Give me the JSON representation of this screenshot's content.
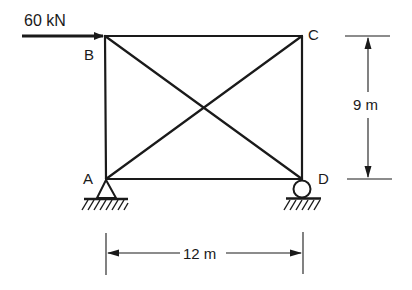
{
  "load": {
    "label": "60 kN",
    "direction": "right",
    "applied_at": "B"
  },
  "nodes": [
    {
      "id": "A",
      "label": "A",
      "x": 106,
      "y": 179,
      "support": "pin"
    },
    {
      "id": "B",
      "label": "B",
      "x": 105,
      "y": 36,
      "support": "none"
    },
    {
      "id": "C",
      "label": "C",
      "x": 302,
      "y": 36,
      "support": "none"
    },
    {
      "id": "D",
      "label": "D",
      "x": 302,
      "y": 179,
      "support": "roller"
    }
  ],
  "members": [
    {
      "from": "A",
      "to": "B"
    },
    {
      "from": "B",
      "to": "C"
    },
    {
      "from": "C",
      "to": "D"
    },
    {
      "from": "A",
      "to": "D"
    },
    {
      "from": "A",
      "to": "C"
    },
    {
      "from": "B",
      "to": "D"
    }
  ],
  "dimensions": {
    "height": {
      "label": "9 m",
      "between": [
        "C",
        "D"
      ]
    },
    "width": {
      "label": "12 m",
      "between": [
        "A",
        "D"
      ]
    }
  },
  "colors": {
    "ink": "#1a1a1a",
    "background": "#ffffff"
  }
}
